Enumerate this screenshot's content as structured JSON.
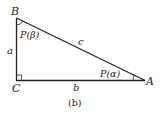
{
  "figure": {
    "caption": "(b)",
    "type": "right-triangle"
  },
  "vertices": {
    "B": {
      "label": "B"
    },
    "C": {
      "label": "C"
    },
    "A": {
      "label": "A"
    }
  },
  "sides": {
    "a": {
      "label": "a"
    },
    "b": {
      "label": "b"
    },
    "c": {
      "label": "c"
    }
  },
  "angles": {
    "beta": {
      "label": "P(β)"
    },
    "alpha": {
      "label": "P(α)"
    }
  },
  "colors": {
    "stroke": "#222222",
    "background": "#ffffff"
  }
}
